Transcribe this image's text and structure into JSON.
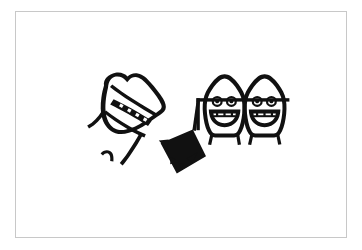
{
  "image": {
    "title": "Hand-drawn ink doodle",
    "medium": "black ink line drawing on white paper",
    "background_color": "#ffffff",
    "ink_color": "#111111",
    "border_color": "#c8c8c8",
    "width": 362,
    "height": 250,
    "description": "Three cartoon heads: a tilted head with a banded mouth of braces on the left, a kite-shaped diamond object in the middle, and two grinning heads wearing a shared horizontal glasses bar on the right."
  },
  "frame": {
    "name": "paper-frame",
    "left": 15,
    "top": 11,
    "width": 332,
    "height": 227,
    "stroke": "#c8c8c8",
    "stroke_width": 1
  },
  "figures": [
    {
      "id": "left-head",
      "label": "Tilted head with braces band",
      "bounds": {
        "x": 82,
        "y": 72,
        "width": 85,
        "height": 80
      },
      "features": [
        "rounded tilted skull",
        "dark horizontal band across face",
        "four small white brace segments inside band",
        "arm stroke extending down-right toward the kite"
      ]
    },
    {
      "id": "hook-mark",
      "label": "Small hook stroke",
      "bounds": {
        "x": 100,
        "y": 150,
        "width": 15,
        "height": 13
      },
      "features": [
        "short curved comma-like mark"
      ]
    },
    {
      "id": "kite-shape",
      "label": "Kite / diamond object",
      "bounds": {
        "x": 158,
        "y": 128,
        "width": 50,
        "height": 46
      },
      "features": [
        "four-sided diamond outline",
        "two solid triangles at lower interior",
        "connector line rising to the right heads"
      ]
    },
    {
      "id": "right-head-a",
      "label": "Grinning head with glasses (left of pair)",
      "bounds": {
        "x": 203,
        "y": 75,
        "width": 45,
        "height": 62
      },
      "features": [
        "pointed rounded skull",
        "two round eyes with pupils",
        "horizontal glasses bar",
        "wide open grin with teeth"
      ]
    },
    {
      "id": "right-head-b",
      "label": "Grinning head with glasses (right of pair)",
      "bounds": {
        "x": 243,
        "y": 75,
        "width": 45,
        "height": 62
      },
      "features": [
        "pointed rounded skull",
        "two round eyes with pupils",
        "horizontal glasses bar",
        "wide open grin with teeth"
      ]
    },
    {
      "id": "glasses-bar",
      "label": "Long horizontal bar joining the kite to the right heads",
      "bounds": {
        "x": 196,
        "y": 100,
        "width": 96,
        "height": 46
      },
      "features": [
        "straight stroke across both faces",
        "vertical drop at the left end"
      ]
    }
  ]
}
